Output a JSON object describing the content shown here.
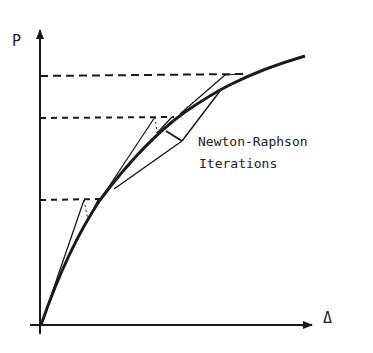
{
  "diagram": {
    "type": "load-displacement curve",
    "y_axis_label": "P",
    "x_axis_label": "Δ",
    "annotation_line1": "Newton-Raphson",
    "annotation_line2": "Iterations",
    "load_levels": 3,
    "colors": {
      "ink": "#1a1a1a",
      "background": "#ffffff"
    }
  }
}
